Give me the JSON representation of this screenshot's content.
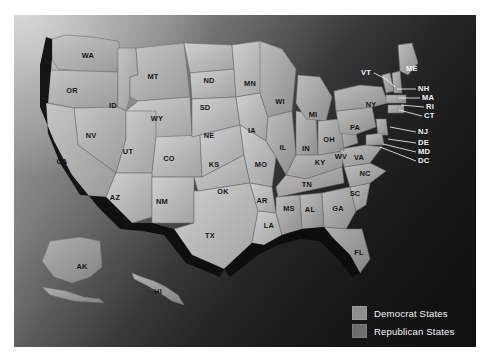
{
  "figure": {
    "background_top_left": "#d6d6d6",
    "background_bottom_right": "#101010"
  },
  "legend": {
    "items": [
      {
        "label": "Democrat States",
        "color": "#8e8e8e",
        "swatch_name": "democrat-swatch"
      },
      {
        "label": "Republican States",
        "color": "#6e6e6e",
        "swatch_name": "republican-swatch"
      }
    ]
  },
  "map": {
    "state_label_color": "#161616",
    "callout_label_color": "#f2f2f2",
    "states": [
      {
        "code": "WA",
        "x": 74,
        "y": 41
      },
      {
        "code": "OR",
        "x": 58,
        "y": 76
      },
      {
        "code": "ID",
        "x": 99,
        "y": 91
      },
      {
        "code": "MT",
        "x": 139,
        "y": 62
      },
      {
        "code": "WY",
        "x": 143,
        "y": 104
      },
      {
        "code": "NV",
        "x": 77,
        "y": 121
      },
      {
        "code": "CA",
        "x": 48,
        "y": 147
      },
      {
        "code": "UT",
        "x": 114,
        "y": 137
      },
      {
        "code": "CO",
        "x": 155,
        "y": 144
      },
      {
        "code": "AZ",
        "x": 101,
        "y": 183
      },
      {
        "code": "NM",
        "x": 148,
        "y": 187
      },
      {
        "code": "ND",
        "x": 195,
        "y": 66
      },
      {
        "code": "SD",
        "x": 191,
        "y": 93
      },
      {
        "code": "NE",
        "x": 195,
        "y": 121
      },
      {
        "code": "KS",
        "x": 200,
        "y": 150
      },
      {
        "code": "OK",
        "x": 209,
        "y": 177
      },
      {
        "code": "TX",
        "x": 196,
        "y": 221
      },
      {
        "code": "MN",
        "x": 236,
        "y": 69
      },
      {
        "code": "IA",
        "x": 238,
        "y": 116
      },
      {
        "code": "MO",
        "x": 247,
        "y": 150
      },
      {
        "code": "AR",
        "x": 248,
        "y": 186
      },
      {
        "code": "LA",
        "x": 255,
        "y": 211
      },
      {
        "code": "WI",
        "x": 266,
        "y": 87
      },
      {
        "code": "IL",
        "x": 269,
        "y": 133
      },
      {
        "code": "IN",
        "x": 292,
        "y": 134
      },
      {
        "code": "MI",
        "x": 299,
        "y": 100
      },
      {
        "code": "OH",
        "x": 315,
        "y": 125
      },
      {
        "code": "KY",
        "x": 306,
        "y": 148
      },
      {
        "code": "TN",
        "x": 293,
        "y": 170
      },
      {
        "code": "MS",
        "x": 275,
        "y": 194
      },
      {
        "code": "AL",
        "x": 296,
        "y": 195
      },
      {
        "code": "GA",
        "x": 324,
        "y": 194
      },
      {
        "code": "FL",
        "x": 345,
        "y": 238
      },
      {
        "code": "SC",
        "x": 341,
        "y": 179
      },
      {
        "code": "NC",
        "x": 351,
        "y": 159
      },
      {
        "code": "VA",
        "x": 345,
        "y": 143
      },
      {
        "code": "WV",
        "x": 327,
        "y": 142
      },
      {
        "code": "PA",
        "x": 341,
        "y": 113
      },
      {
        "code": "NY",
        "x": 357,
        "y": 90
      },
      {
        "code": "AK",
        "x": 68,
        "y": 252
      },
      {
        "code": "HI",
        "x": 144,
        "y": 277
      }
    ],
    "callouts": [
      {
        "code": "VT",
        "label_x": 357,
        "label_y": 58,
        "anchor": "end",
        "line": "360,58 372,64 381,72"
      },
      {
        "code": "ME",
        "label_x": 392,
        "label_y": 54,
        "anchor": "start",
        "line": ""
      },
      {
        "code": "NH",
        "label_x": 404,
        "label_y": 74,
        "anchor": "start",
        "line": "402,74 383,74"
      },
      {
        "code": "MA",
        "label_x": 408,
        "label_y": 83,
        "anchor": "start",
        "line": "406,83 385,83"
      },
      {
        "code": "RI",
        "label_x": 412,
        "label_y": 92,
        "anchor": "start",
        "line": "410,92 387,90"
      },
      {
        "code": "CT",
        "label_x": 410,
        "label_y": 101,
        "anchor": "start",
        "line": "408,101 385,95"
      },
      {
        "code": "NJ",
        "label_x": 404,
        "label_y": 117,
        "anchor": "start",
        "line": "402,117 376,112"
      },
      {
        "code": "DE",
        "label_x": 404,
        "label_y": 128,
        "anchor": "start",
        "line": "402,128 374,124"
      },
      {
        "code": "MD",
        "label_x": 404,
        "label_y": 137,
        "anchor": "start",
        "line": "402,137 369,129"
      },
      {
        "code": "DC",
        "label_x": 404,
        "label_y": 146,
        "anchor": "start",
        "line": "402,146 366,132"
      }
    ]
  }
}
